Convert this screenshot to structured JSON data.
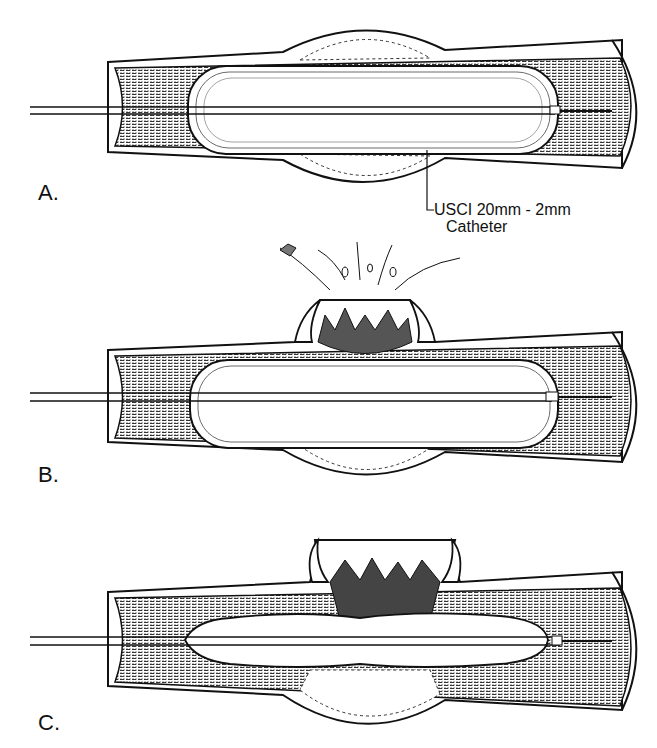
{
  "figure": {
    "panels": [
      {
        "id": "A",
        "label": "A.",
        "description": "Balloon catheter inflated within artery; plaque compressed outward against vessel wall"
      },
      {
        "id": "B",
        "label": "B.",
        "description": "Balloon inflated; vessel wall ruptures above with plaque fragments spraying out"
      },
      {
        "id": "C",
        "label": "C.",
        "description": "Deflated balloon within vessel; torn wall and disrupted plaque remain"
      }
    ],
    "callout": {
      "line1": "USCI 20mm - 2mm",
      "line2": "Catheter"
    }
  },
  "colors": {
    "ink": "#111111",
    "stipple": "#8a8a8a",
    "background": "#ffffff"
  }
}
